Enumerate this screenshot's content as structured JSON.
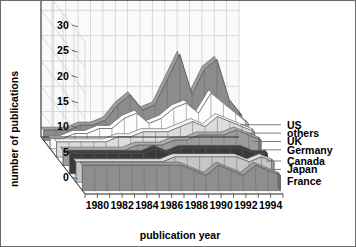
{
  "chart_data": {
    "type": "area",
    "title": "",
    "subtitle": "",
    "xlabel": "publication year",
    "ylabel": "number of publications",
    "zlabel": "",
    "grid": true,
    "legend_position": "right",
    "style": "3d-stacked-ribbon",
    "x": [
      1979,
      1980,
      1981,
      1982,
      1983,
      1984,
      1985,
      1986,
      1987,
      1988,
      1989,
      1990,
      1991,
      1992,
      1993,
      1994,
      1995
    ],
    "xtick_labels": [
      "1980",
      "1982",
      "1984",
      "1986",
      "1988",
      "1990",
      "1992",
      "1994"
    ],
    "xtick_values": [
      1980,
      1982,
      1984,
      1986,
      1988,
      1990,
      1992,
      1994
    ],
    "ytick_labels": [
      "0",
      "5",
      "10",
      "15",
      "20",
      "25",
      "30"
    ],
    "ytick_values": [
      0,
      5,
      10,
      15,
      20,
      25,
      30
    ],
    "ylim": [
      0,
      30
    ],
    "xlim": [
      1979,
      1995
    ],
    "categories": [
      "1979",
      "1980",
      "1981",
      "1982",
      "1983",
      "1984",
      "1985",
      "1986",
      "1987",
      "1988",
      "1989",
      "1990",
      "1991",
      "1992",
      "1993",
      "1994",
      "1995"
    ],
    "series": [
      {
        "name": "France",
        "color": "#8e8e8e",
        "values": [
          5,
          5,
          5,
          5,
          5,
          5,
          5,
          5,
          5,
          4,
          3,
          5,
          4,
          3,
          5,
          4,
          3
        ]
      },
      {
        "name": "Japan",
        "color": "#c6c6c6",
        "values": [
          4,
          4,
          4,
          4,
          4,
          4,
          4,
          4,
          5,
          5,
          5,
          5,
          5,
          5,
          4,
          5,
          4
        ]
      },
      {
        "name": "Canada",
        "color": "#3a3a3a",
        "values": [
          4,
          4,
          4,
          4,
          4,
          4,
          4,
          5,
          4,
          5,
          5,
          5,
          5,
          5,
          5,
          4,
          4
        ]
      },
      {
        "name": "Germany",
        "color": "#9b9b9b",
        "values": [
          3,
          3,
          3,
          3,
          3,
          3,
          4,
          4,
          4,
          5,
          5,
          6,
          6,
          6,
          7,
          6,
          5
        ]
      },
      {
        "name": "UK",
        "color": "#dcdcdc",
        "values": [
          3,
          3,
          3,
          3,
          3,
          4,
          4,
          5,
          5,
          5,
          6,
          7,
          6,
          8,
          7,
          6,
          5
        ]
      },
      {
        "name": "others",
        "color": "#fdfdfd",
        "values": [
          2,
          2,
          3,
          3,
          4,
          4,
          6,
          7,
          5,
          6,
          8,
          9,
          7,
          11,
          9,
          7,
          5
        ]
      },
      {
        "name": "US",
        "color": "#8c8c8c",
        "values": [
          2,
          2,
          2,
          3,
          3,
          4,
          7,
          9,
          6,
          7,
          12,
          17,
          9,
          14,
          16,
          8,
          5
        ]
      }
    ],
    "legend": [
      {
        "label": "US"
      },
      {
        "label": "others"
      },
      {
        "label": "UK"
      },
      {
        "label": "Germany"
      },
      {
        "label": "Canada"
      },
      {
        "label": "Japan"
      },
      {
        "label": "France"
      }
    ]
  }
}
